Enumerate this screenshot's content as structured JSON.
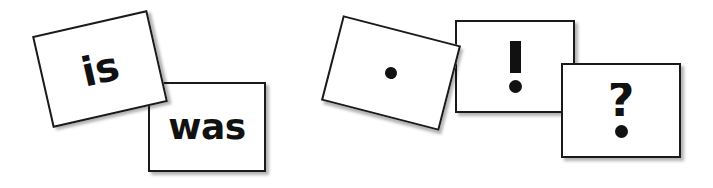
{
  "page": {
    "background_color": "#ffffff",
    "card_fill": "#ffffff",
    "card_border_color": "#1a1a1a",
    "glyph_color": "#111111"
  },
  "groups": [
    {
      "name": "word-cards",
      "cards": [
        {
          "id": "is",
          "label": "is",
          "kind": "word",
          "rotation": -12.8
        },
        {
          "id": "was",
          "label": "was",
          "kind": "word",
          "rotation": 0
        }
      ]
    },
    {
      "name": "punctuation-cards",
      "cards": [
        {
          "id": "period",
          "label": ".",
          "kind": "punctuation",
          "rotation": 14.5
        },
        {
          "id": "exclaim",
          "label": "!",
          "kind": "punctuation",
          "rotation": 0
        },
        {
          "id": "question",
          "label": "?",
          "kind": "punctuation",
          "rotation": 0
        }
      ]
    }
  ],
  "glyphs": {
    "question_hook": "?"
  }
}
